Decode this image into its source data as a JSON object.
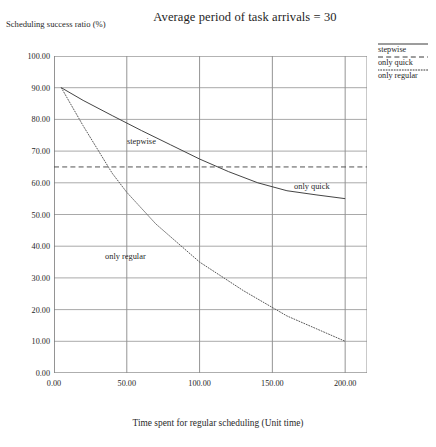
{
  "chart_data": {
    "type": "line",
    "title": "Average period of task arrivals = 30",
    "xlabel": "Time spent for regular scheduling  (Unit time)",
    "ylabel": "Scheduling success ratio (%)",
    "xlim": [
      0,
      215
    ],
    "ylim": [
      0,
      100
    ],
    "grid": true,
    "legend_position": "top-right",
    "xticks": [
      0,
      50,
      100,
      150,
      200
    ],
    "xtick_labels": [
      "0.00",
      "50.00",
      "100.00",
      "150.00",
      "200.00"
    ],
    "yticks": [
      0,
      10,
      20,
      30,
      40,
      50,
      60,
      70,
      80,
      90,
      100
    ],
    "ytick_labels": [
      "0.00",
      "10.00",
      "20.00",
      "30.00",
      "40.00",
      "50.00",
      "60.00",
      "70.00",
      "80.00",
      "90.00",
      "100.00"
    ],
    "series": [
      {
        "name": "stepwise",
        "style": "solid",
        "color": "#3a3a3a",
        "x": [
          5,
          20,
          40,
          60,
          80,
          100,
          120,
          140,
          160,
          180,
          200
        ],
        "values": [
          90.0,
          86.0,
          81.2,
          76.5,
          72.0,
          67.5,
          63.5,
          60.0,
          57.5,
          56.2,
          55.0
        ]
      },
      {
        "name": "only quick",
        "style": "dashed",
        "color": "#4a4a4a",
        "x": [
          0,
          50,
          100,
          150,
          200,
          215
        ],
        "values": [
          65.0,
          65.0,
          65.0,
          65.0,
          65.0,
          65.0
        ]
      },
      {
        "name": "only regular",
        "style": "dotted",
        "color": "#5a5a5a",
        "x": [
          5,
          20,
          40,
          50,
          70,
          100,
          130,
          160,
          180,
          200
        ],
        "values": [
          90.0,
          78.0,
          63.0,
          57.0,
          47.0,
          35.0,
          26.0,
          18.0,
          14.0,
          10.0
        ]
      }
    ],
    "annotations": [
      {
        "text": "stepwise",
        "x_px": 127,
        "y_px": 137
      },
      {
        "text": "only quick",
        "x_px": 294,
        "y_px": 182
      },
      {
        "text": "only regular",
        "x_px": 105,
        "y_px": 252
      }
    ]
  },
  "legend": {
    "items": [
      {
        "label": "stepwise",
        "style": "solid"
      },
      {
        "label": "only quick",
        "style": "dashed"
      },
      {
        "label": "only regular",
        "style": "dotted"
      }
    ]
  }
}
